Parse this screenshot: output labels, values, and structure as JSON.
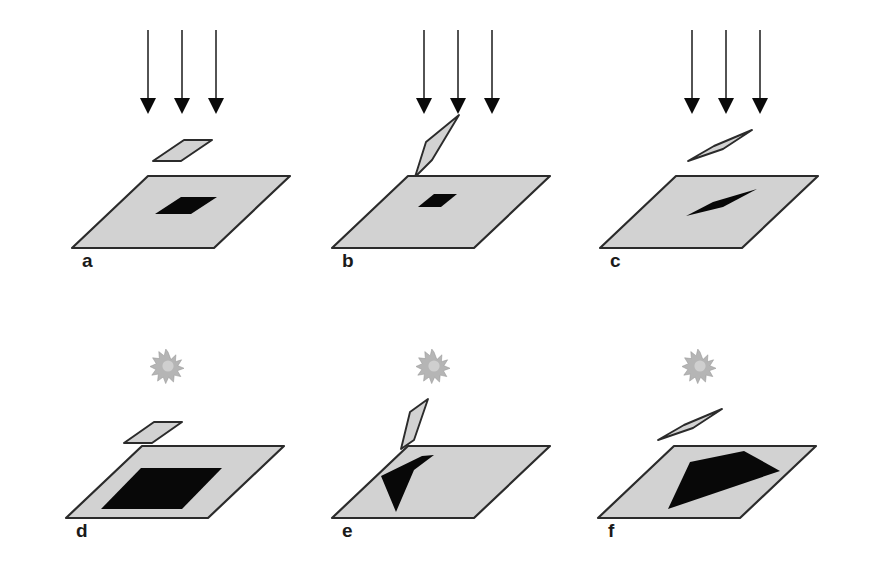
{
  "figure": {
    "width": 875,
    "height": 568,
    "background_color": "#ffffff"
  },
  "colors": {
    "plate_fill": "#d2d2d2",
    "plate_outline": "#2b2b2b",
    "shadow_fill": "#080808",
    "ray_color": "#1a1a1a",
    "sun_color": "#b5b5b5",
    "label_color": "#1a1a1a"
  },
  "rows": [
    {
      "id": "row-parallel",
      "light_source": "parallel-rays",
      "light_label": "parallel beam arrows"
    },
    {
      "id": "row-point",
      "light_source": "point-source",
      "light_label": "sun starburst"
    }
  ],
  "panels": [
    {
      "id": "panel-a",
      "label": "a",
      "light": "parallel-rays",
      "object_orientation": "horizontal",
      "object_name": "small-horizontal-plate",
      "shadow_name": "small-parallelogram-shadow",
      "shadow_size": "small",
      "ray_count": 3
    },
    {
      "id": "panel-b",
      "label": "b",
      "light": "parallel-rays",
      "object_orientation": "near-vertical",
      "object_name": "vertical-blade",
      "shadow_name": "tiny-parallelogram-shadow",
      "shadow_size": "tiny",
      "ray_count": 3
    },
    {
      "id": "panel-c",
      "label": "c",
      "light": "parallel-rays",
      "object_orientation": "tilted-lens",
      "object_name": "tilted-sliver",
      "shadow_name": "thin-lens-shadow",
      "shadow_size": "thin",
      "ray_count": 3
    },
    {
      "id": "panel-d",
      "label": "d",
      "light": "point-source",
      "object_orientation": "horizontal",
      "object_name": "small-horizontal-plate",
      "shadow_name": "large-parallelogram-shadow",
      "shadow_size": "large",
      "ray_count": 0
    },
    {
      "id": "panel-e",
      "label": "e",
      "light": "point-source",
      "object_orientation": "near-vertical",
      "object_name": "vertical-blade",
      "shadow_name": "tapered-wedge-shadow",
      "shadow_size": "medium",
      "ray_count": 0
    },
    {
      "id": "panel-f",
      "label": "f",
      "light": "point-source",
      "object_orientation": "tilted-lens",
      "object_name": "tilted-sliver",
      "shadow_name": "large-quadrilateral-shadow",
      "shadow_size": "very-large",
      "ray_count": 0
    }
  ],
  "geometry": {
    "panel_a": {
      "ground_plate": "72,248 148,176 290,176 214,248",
      "float_plate": "155,160 186,140 212,140 181,160",
      "shadow": "156,213 182,197 216,197 190,213",
      "label_xy": [
        82,
        266
      ],
      "rays_x": [
        148,
        182,
        216
      ],
      "ray_top_y": 30,
      "ray_bottom_y": 112
    },
    "panel_b": {
      "ground_plate": "332,248 408,176 550,176 474,248",
      "float_plate": "415,176 428,134 443,124 424,166",
      "shadow": "418,205 434,194 456,194 440,205",
      "label_xy": [
        342,
        266
      ],
      "rays_x": [
        424,
        458,
        492
      ],
      "ray_top_y": 30,
      "ray_bottom_y": 112
    },
    "panel_c": {
      "ground_plate": "600,248 676,176 818,176 742,248",
      "float_plate": "689,158 716,145 752,131 722,146",
      "shadow": "687,214 714,202 756,190 722,205",
      "label_xy": [
        610,
        266
      ],
      "rays_x": [
        692,
        726,
        760
      ],
      "ray_top_y": 30,
      "ray_bottom_y": 112
    },
    "panel_d": {
      "ground_plate": "66,518 142,446 284,446 208,518",
      "float_plate": "126,442 156,422 182,422 152,442",
      "shadow": "103,508 142,468 220,468 181,508",
      "label_xy": [
        76,
        536
      ],
      "sun_xy": [
        168,
        366
      ]
    },
    "panel_e": {
      "ground_plate": "332,518 408,446 550,446 474,518",
      "float_plate": "400,447 412,408 428,398 412,438",
      "shadow": "394,512 383,474 434,455 424,468",
      "label_xy": [
        342,
        536
      ],
      "sun_xy": [
        434,
        366
      ]
    },
    "panel_f": {
      "ground_plate": "598,518 674,446 816,446 740,518",
      "float_plate": "660,438 688,424 724,410 694,426",
      "shadow": "668,508 690,463 744,452 778,470",
      "label_xy": [
        608,
        536
      ],
      "sun_xy": [
        700,
        366
      ]
    }
  }
}
